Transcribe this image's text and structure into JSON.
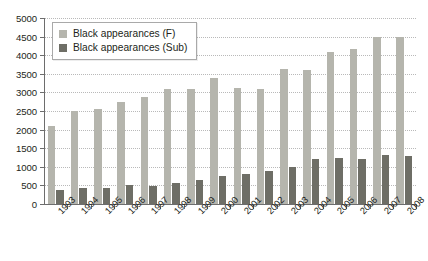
{
  "chart_data": {
    "type": "bar",
    "title": "",
    "subtitle": "",
    "xlabel": "",
    "ylabel": "",
    "ylim": [
      0,
      5000
    ],
    "ytick_interval": 500,
    "yticks": [
      0,
      500,
      1000,
      1500,
      2000,
      2500,
      3000,
      3500,
      4000,
      4500,
      5000
    ],
    "ytick_labels": [
      "0",
      "500",
      "1000",
      "1500",
      "2000",
      "2500",
      "3000",
      "3500",
      "4000",
      "4500",
      "5000"
    ],
    "grid": true,
    "grid_style": "dotted-horizontal",
    "legend_position": "top-left-inside",
    "categories": [
      "1993",
      "1994",
      "1995",
      "1996",
      "1997",
      "1998",
      "1999",
      "2000",
      "2001",
      "2002",
      "2003",
      "2004",
      "2005",
      "2006",
      "2007",
      "2008"
    ],
    "series": [
      {
        "name": "Black appearances (F)",
        "color": "#b5b5ad",
        "values": [
          2100,
          2500,
          2550,
          2750,
          2880,
          3080,
          3080,
          3380,
          3120,
          3080,
          3620,
          3600,
          4080,
          4180,
          4500,
          4500
        ]
      },
      {
        "name": "Black appearances (Sub)",
        "color": "#6e6e66",
        "values": [
          370,
          420,
          440,
          500,
          490,
          560,
          650,
          760,
          800,
          900,
          1000,
          1200,
          1230,
          1220,
          1330,
          1300
        ]
      }
    ]
  },
  "legend": {
    "items": [
      {
        "label": "Black appearances (F)",
        "swatch": "legend-swatch-light"
      },
      {
        "label": "Black appearances (Sub)",
        "swatch": "legend-swatch-dark"
      }
    ]
  },
  "axes": {
    "y_axis_name": "y-axis",
    "x_axis_name": "x-axis"
  }
}
